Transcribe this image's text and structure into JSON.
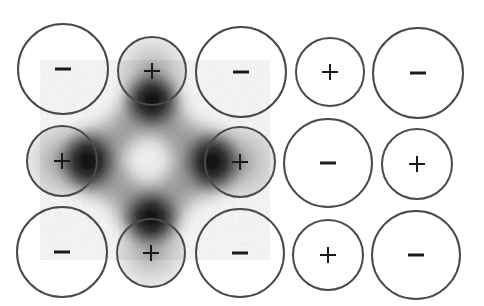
{
  "figure": {
    "colors": {
      "background": "#ffffff",
      "circle_stroke": "#4a4a4a",
      "sign_color": "#1a1a1a",
      "cloud_dark": "#0a0a0a",
      "cloud_light": "#ffffff"
    }
  },
  "ions": [
    {
      "id": "r1c1",
      "row": 1,
      "col": 1,
      "sign": "−",
      "charge": "negative",
      "cx": 63,
      "cy": 69,
      "r": 45
    },
    {
      "id": "r1c2",
      "row": 1,
      "col": 2,
      "sign": "+",
      "charge": "positive",
      "cx": 152,
      "cy": 71,
      "r": 34
    },
    {
      "id": "r1c3",
      "row": 1,
      "col": 3,
      "sign": "−",
      "charge": "negative",
      "cx": 241,
      "cy": 72,
      "r": 45
    },
    {
      "id": "r1c4",
      "row": 1,
      "col": 4,
      "sign": "+",
      "charge": "positive",
      "cx": 330,
      "cy": 72,
      "r": 34
    },
    {
      "id": "r1c5",
      "row": 1,
      "col": 5,
      "sign": "−",
      "charge": "negative",
      "cx": 418,
      "cy": 73,
      "r": 45
    },
    {
      "id": "r2c1",
      "row": 2,
      "col": 1,
      "sign": "+",
      "charge": "positive",
      "cx": 62,
      "cy": 161,
      "r": 35
    },
    {
      "id": "r2c3",
      "row": 2,
      "col": 3,
      "sign": "+",
      "charge": "positive",
      "cx": 240,
      "cy": 162,
      "r": 35
    },
    {
      "id": "r2c4",
      "row": 2,
      "col": 4,
      "sign": "−",
      "charge": "negative",
      "cx": 328,
      "cy": 163,
      "r": 44
    },
    {
      "id": "r2c5",
      "row": 2,
      "col": 5,
      "sign": "+",
      "charge": "positive",
      "cx": 417,
      "cy": 164,
      "r": 35
    },
    {
      "id": "r3c1",
      "row": 3,
      "col": 1,
      "sign": "−",
      "charge": "negative",
      "cx": 62,
      "cy": 252,
      "r": 45
    },
    {
      "id": "r3c2",
      "row": 3,
      "col": 2,
      "sign": "+",
      "charge": "positive",
      "cx": 151,
      "cy": 253,
      "r": 34
    },
    {
      "id": "r3c3",
      "row": 3,
      "col": 3,
      "sign": "−",
      "charge": "negative",
      "cx": 240,
      "cy": 253,
      "r": 44
    },
    {
      "id": "r3c4",
      "row": 3,
      "col": 4,
      "sign": "+",
      "charge": "positive",
      "cx": 328,
      "cy": 255,
      "r": 35
    },
    {
      "id": "r3c5",
      "row": 3,
      "col": 5,
      "sign": "−",
      "charge": "negative",
      "cx": 416,
      "cy": 255,
      "r": 44
    }
  ],
  "electron_cloud": {
    "center": {
      "x": 150,
      "y": 161
    },
    "lobes": [
      {
        "direction": "up",
        "x": 152,
        "y": 105
      },
      {
        "direction": "left",
        "x": 92,
        "y": 161
      },
      {
        "direction": "right",
        "x": 208,
        "y": 162
      },
      {
        "direction": "down",
        "x": 151,
        "y": 215
      }
    ]
  }
}
